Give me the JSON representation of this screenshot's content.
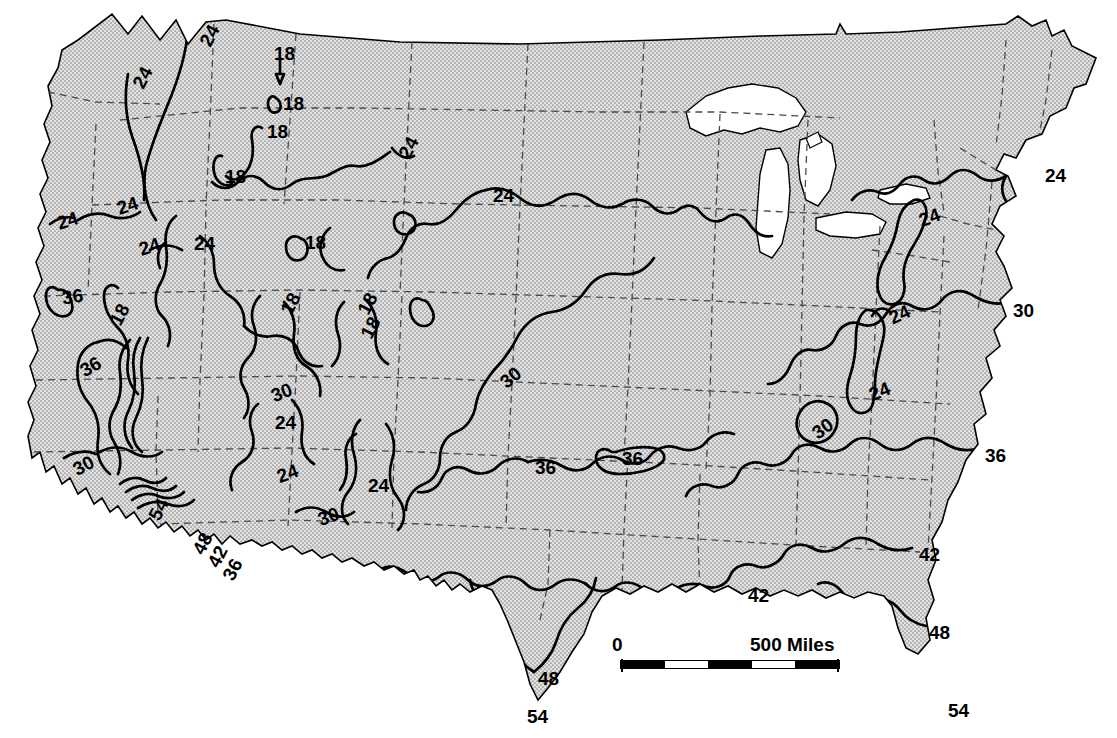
{
  "figure": {
    "type": "isopleth-contour-map",
    "region": "Contiguous United States",
    "quantity": "Mean annual temperature",
    "unit": "degrees Fahrenheit",
    "contour_interval": 6,
    "contour_values": [
      18,
      24,
      30,
      36,
      42,
      48,
      54
    ]
  },
  "colors": {
    "land_fill": "#d6d6d6",
    "land_stipple": "#8d8d8d",
    "water_fill": "#ffffff",
    "coastline": "#000000",
    "state_boundary": "#444444",
    "contour_line": "#000000",
    "background": "#ffffff",
    "label_color": "#000000"
  },
  "scale_bar": {
    "zero_label": "0",
    "max_label": "500 Miles",
    "segments": [
      "on",
      "off",
      "on",
      "off",
      "on"
    ],
    "segment_count": 5
  },
  "contour_labels": [
    {
      "id": "l01",
      "text": "24",
      "x": 199,
      "y": 26,
      "rot": -62,
      "size": 19
    },
    {
      "id": "l02",
      "text": "18",
      "x": 274,
      "y": 44,
      "rot": 0,
      "size": 19
    },
    {
      "id": "l03",
      "text": "24",
      "x": 132,
      "y": 68,
      "rot": -62,
      "size": 19
    },
    {
      "id": "l04",
      "text": "18",
      "x": 283,
      "y": 94,
      "rot": 0,
      "size": 19
    },
    {
      "id": "l05",
      "text": "18",
      "x": 267,
      "y": 122,
      "rot": 0,
      "size": 19
    },
    {
      "id": "l06",
      "text": "18",
      "x": 225,
      "y": 167,
      "rot": 0,
      "size": 19
    },
    {
      "id": "l07",
      "text": "24",
      "x": 398,
      "y": 138,
      "rot": -62,
      "size": 19
    },
    {
      "id": "l08",
      "text": "24",
      "x": 1045,
      "y": 166,
      "rot": 0,
      "size": 19
    },
    {
      "id": "l09",
      "text": "24",
      "x": 493,
      "y": 186,
      "rot": 0,
      "size": 19
    },
    {
      "id": "l10",
      "text": "24",
      "x": 117,
      "y": 196,
      "rot": -18,
      "size": 19
    },
    {
      "id": "l11",
      "text": "24",
      "x": 57,
      "y": 211,
      "rot": -18,
      "size": 19
    },
    {
      "id": "l12",
      "text": "24",
      "x": 919,
      "y": 208,
      "rot": -20,
      "size": 19
    },
    {
      "id": "l13",
      "text": "24",
      "x": 139,
      "y": 237,
      "rot": -18,
      "size": 19
    },
    {
      "id": "l14",
      "text": "24",
      "x": 194,
      "y": 234,
      "rot": 0,
      "size": 19
    },
    {
      "id": "l15",
      "text": "18",
      "x": 305,
      "y": 233,
      "rot": 0,
      "size": 19
    },
    {
      "id": "l16",
      "text": "36",
      "x": 62,
      "y": 287,
      "rot": -8,
      "size": 19
    },
    {
      "id": "l17",
      "text": "18",
      "x": 109,
      "y": 305,
      "rot": -62,
      "size": 19
    },
    {
      "id": "l18",
      "text": "18",
      "x": 280,
      "y": 294,
      "rot": -62,
      "size": 19
    },
    {
      "id": "l19",
      "text": "18",
      "x": 357,
      "y": 294,
      "rot": -62,
      "size": 19
    },
    {
      "id": "l20",
      "text": "30",
      "x": 1013,
      "y": 301,
      "rot": 0,
      "size": 19
    },
    {
      "id": "l21",
      "text": "24",
      "x": 889,
      "y": 305,
      "rot": -25,
      "size": 19
    },
    {
      "id": "l22",
      "text": "18",
      "x": 360,
      "y": 318,
      "rot": -62,
      "size": 19
    },
    {
      "id": "l23",
      "text": "36",
      "x": 80,
      "y": 357,
      "rot": -30,
      "size": 19
    },
    {
      "id": "l24",
      "text": "30",
      "x": 271,
      "y": 383,
      "rot": -22,
      "size": 19
    },
    {
      "id": "l25",
      "text": "30",
      "x": 500,
      "y": 368,
      "rot": -40,
      "size": 19
    },
    {
      "id": "l26",
      "text": "24",
      "x": 869,
      "y": 382,
      "rot": -22,
      "size": 19
    },
    {
      "id": "l27",
      "text": "24",
      "x": 275,
      "y": 413,
      "rot": 0,
      "size": 19
    },
    {
      "id": "l28",
      "text": "30",
      "x": 812,
      "y": 419,
      "rot": -35,
      "size": 19
    },
    {
      "id": "l29",
      "text": "30",
      "x": 73,
      "y": 456,
      "rot": -28,
      "size": 19
    },
    {
      "id": "l30",
      "text": "36",
      "x": 985,
      "y": 446,
      "rot": 0,
      "size": 19
    },
    {
      "id": "l31",
      "text": "36",
      "x": 535,
      "y": 458,
      "rot": 0,
      "size": 19
    },
    {
      "id": "l32",
      "text": "36",
      "x": 622,
      "y": 449,
      "rot": 0,
      "size": 19
    },
    {
      "id": "l33",
      "text": "24",
      "x": 277,
      "y": 464,
      "rot": -20,
      "size": 19
    },
    {
      "id": "l34",
      "text": "24",
      "x": 368,
      "y": 476,
      "rot": 0,
      "size": 19
    },
    {
      "id": "l35",
      "text": "54",
      "x": 148,
      "y": 500,
      "rot": -62,
      "size": 19
    },
    {
      "id": "l36",
      "text": "30",
      "x": 318,
      "y": 507,
      "rot": -20,
      "size": 19
    },
    {
      "id": "l37",
      "text": "48",
      "x": 192,
      "y": 534,
      "rot": -62,
      "size": 19
    },
    {
      "id": "l38",
      "text": "42",
      "x": 207,
      "y": 547,
      "rot": -62,
      "size": 19
    },
    {
      "id": "l39",
      "text": "36",
      "x": 222,
      "y": 560,
      "rot": -62,
      "size": 19
    },
    {
      "id": "l40",
      "text": "42",
      "x": 919,
      "y": 545,
      "rot": 0,
      "size": 19
    },
    {
      "id": "l41",
      "text": "42",
      "x": 748,
      "y": 586,
      "rot": 0,
      "size": 19
    },
    {
      "id": "l42",
      "text": "48",
      "x": 929,
      "y": 623,
      "rot": 0,
      "size": 19
    },
    {
      "id": "l43",
      "text": "48",
      "x": 538,
      "y": 669,
      "rot": 0,
      "size": 19
    },
    {
      "id": "l44",
      "text": "54",
      "x": 527,
      "y": 707,
      "rot": 0,
      "size": 19
    },
    {
      "id": "l45",
      "text": "54",
      "x": 948,
      "y": 701,
      "rot": 0,
      "size": 19
    }
  ],
  "chart_data": {
    "type": "contour-map",
    "title": "",
    "xlabel": "",
    "ylabel": "",
    "contour_interval": 6,
    "levels": [
      18,
      24,
      30,
      36,
      42,
      48,
      54
    ],
    "units": "°F",
    "label_counts": {
      "18": 8,
      "24": 17,
      "30": 7,
      "36": 6,
      "42": 3,
      "48": 3,
      "54": 3
    },
    "legend": "none",
    "grid": false,
    "annotations": [
      "0",
      "500 Miles"
    ]
  }
}
